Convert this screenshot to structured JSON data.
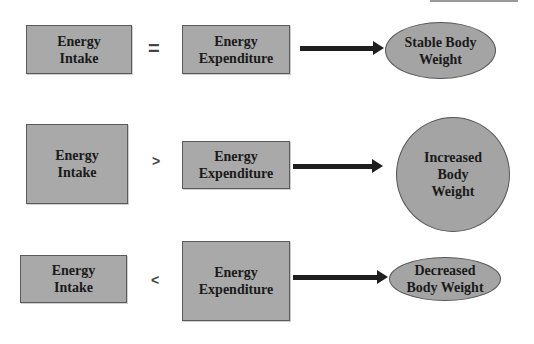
{
  "diagram": {
    "rows": [
      {
        "left": {
          "line1": "Energy",
          "line2": "Intake"
        },
        "operator": "=",
        "right": {
          "line1": "Energy",
          "line2": "Expenditure"
        },
        "result": {
          "line1": "Stable Body",
          "line2": "Weight",
          "line3": ""
        }
      },
      {
        "left": {
          "line1": "Energy",
          "line2": "Intake"
        },
        "operator": ">",
        "right": {
          "line1": "Energy",
          "line2": "Expenditure"
        },
        "result": {
          "line1": "Increased",
          "line2": "Body",
          "line3": "Weight"
        }
      },
      {
        "left": {
          "line1": "Energy",
          "line2": "Intake"
        },
        "operator": "<",
        "right": {
          "line1": "Energy",
          "line2": "Expenditure"
        },
        "result": {
          "line1": "Decreased",
          "line2": "Body Weight",
          "line3": ""
        }
      }
    ],
    "colors": {
      "box_fill": "#a9a9a9",
      "border": "#5a5a5a",
      "arrow": "#1e1e1e",
      "text": "#1a1a1a"
    }
  }
}
